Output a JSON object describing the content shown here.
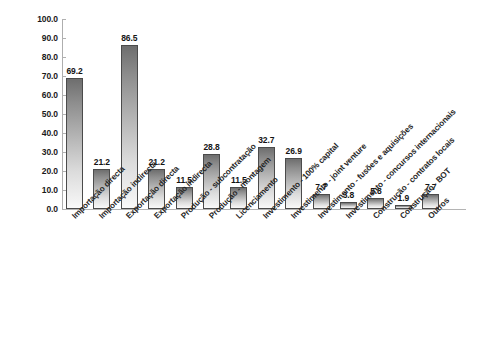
{
  "chart_data": {
    "type": "bar",
    "title": "",
    "subtitle": "",
    "xlabel": "",
    "ylabel": "",
    "ylim": [
      0,
      100
    ],
    "ytick_step": 10,
    "grid": false,
    "legend": false,
    "categories": [
      "Importação directa",
      "Importação indirecta",
      "Exportação directa",
      "Exportação indirecta",
      "Produção - subcontratação",
      "Produção - montagem",
      "Licenciamento",
      "Investimento - 100% capital",
      "Investimento - joint venture",
      "Investimento - fusões e aquisições",
      "Investimento - concursos internacionais",
      "Construção - contratos locais",
      "Construção - BOT",
      "Outros"
    ],
    "values": [
      69.2,
      21.2,
      86.5,
      21.2,
      11.5,
      28.8,
      11.5,
      32.7,
      26.9,
      7.7,
      3.8,
      5.8,
      1.9,
      7.7
    ],
    "value_labels": [
      "69.2",
      "21.2",
      "86.5",
      "21.2",
      "11.5",
      "28.8",
      "11.5",
      "32.7",
      "26.9",
      "7.7",
      "3.8",
      "5.8",
      "1.9",
      "7.7"
    ],
    "ytick_labels": [
      "100.0",
      "90.0",
      "80.0",
      "70.0",
      "60.0",
      "50.0",
      "40.0",
      "30.0",
      "20.0",
      "10.0",
      "0.0"
    ],
    "ytick_values": [
      100,
      90,
      80,
      70,
      60,
      50,
      40,
      30,
      20,
      10,
      0
    ],
    "colors": {
      "bar_top": "#6e6e6e",
      "bar_bottom": "#fafafa",
      "bar_border": "#4b4b4b",
      "axis": "#b0b0b0",
      "text": "#1a1a1a",
      "background": "#ffffff"
    }
  }
}
